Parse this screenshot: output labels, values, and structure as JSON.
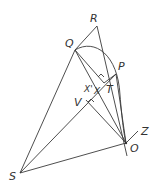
{
  "diagram": {
    "labels": {
      "R": "R",
      "Q": "Q",
      "P": "P",
      "T": "T",
      "X_prime": "X'",
      "X": "X",
      "V": "V",
      "S": "S",
      "O": "O",
      "Z": "Z"
    },
    "points": {
      "R": [
        97,
        26
      ],
      "Q": [
        75,
        50
      ],
      "P": [
        116,
        74
      ],
      "T": [
        104,
        83
      ],
      "X": [
        96,
        91
      ],
      "V": [
        86,
        100
      ],
      "S": [
        20,
        173
      ],
      "O": [
        126,
        143
      ],
      "Z": [
        138,
        131
      ]
    },
    "stroke_color": "#3a3a3a"
  }
}
